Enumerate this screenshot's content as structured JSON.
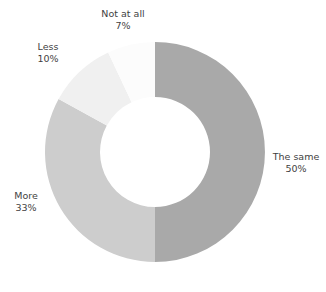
{
  "chart_data": {
    "type": "pie",
    "variant": "donut",
    "title": "",
    "subtitle": "",
    "xlabel": "",
    "ylabel": "",
    "grid": false,
    "legend": "none",
    "labels_position": "outside",
    "start_angle_deg": 0,
    "direction": "clockwise",
    "center": [
      155,
      152
    ],
    "outer_radius": 110,
    "inner_radius": 55,
    "background_color": "#ffffff",
    "label_text_color": "#3f3f3f",
    "categories": [
      "The same",
      "More",
      "Less",
      "Not at all"
    ],
    "values": [
      50,
      33,
      10,
      7
    ],
    "value_unit": "%",
    "colors": [
      "#a9a9a9",
      "#cdcdcd",
      "#f0f0f0",
      "#fcfcfc"
    ],
    "slices": [
      {
        "label": "The same",
        "value": 50,
        "value_text": "50%",
        "color": "#a9a9a9",
        "start_deg": 0,
        "end_deg": 180
      },
      {
        "label": "More",
        "value": 33,
        "value_text": "33%",
        "color": "#cdcdcd",
        "start_deg": 180,
        "end_deg": 298.8
      },
      {
        "label": "Less",
        "value": 10,
        "value_text": "10%",
        "color": "#f0f0f0",
        "start_deg": 298.8,
        "end_deg": 334.8
      },
      {
        "label": "Not at all",
        "value": 7,
        "value_text": "7%",
        "color": "#fcfcfc",
        "start_deg": 334.8,
        "end_deg": 360
      }
    ]
  }
}
